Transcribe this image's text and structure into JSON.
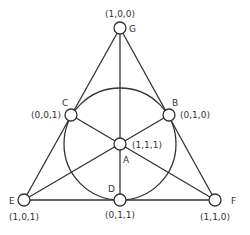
{
  "diagram": {
    "type": "fano-plane",
    "colors": {
      "stroke": "#333333",
      "background": "#ffffff"
    },
    "inscribed_circle": {
      "cx": 120,
      "cy": 144,
      "r": 56
    },
    "nodes": [
      {
        "id": "G",
        "label": "G",
        "coords": "(1,0,0)",
        "x": 120,
        "y": 28
      },
      {
        "id": "C",
        "label": "C",
        "coords": "(0,0,1)",
        "x": 71,
        "y": 115
      },
      {
        "id": "B",
        "label": "B",
        "coords": "(0,1,0)",
        "x": 169,
        "y": 115
      },
      {
        "id": "A",
        "label": "A",
        "coords": "(1,1,1)",
        "x": 120,
        "y": 144
      },
      {
        "id": "E",
        "label": "E",
        "coords": "(1,0,1)",
        "x": 24,
        "y": 200
      },
      {
        "id": "D",
        "label": "D",
        "coords": "(0,1,1)",
        "x": 120,
        "y": 200
      },
      {
        "id": "F",
        "label": "F",
        "coords": "(1,1,0)",
        "x": 215,
        "y": 200
      }
    ],
    "lines": [
      [
        "G",
        "E"
      ],
      [
        "G",
        "F"
      ],
      [
        "E",
        "F"
      ],
      [
        "G",
        "D"
      ],
      [
        "E",
        "B"
      ],
      [
        "F",
        "C"
      ]
    ]
  }
}
